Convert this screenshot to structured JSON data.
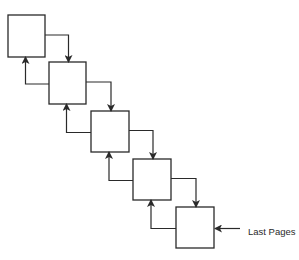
{
  "diagram": {
    "type": "linked-page-chain",
    "stroke_color": "#2a2a2a",
    "background": "#ffffff",
    "boxes": [
      {
        "id": "page-1",
        "x": 8,
        "y": 15,
        "w": 37,
        "h": 42
      },
      {
        "id": "page-2",
        "x": 49,
        "y": 62,
        "w": 37,
        "h": 42
      },
      {
        "id": "page-3",
        "x": 91,
        "y": 111,
        "w": 38,
        "h": 41
      },
      {
        "id": "page-4",
        "x": 133,
        "y": 159,
        "w": 38,
        "h": 41
      },
      {
        "id": "page-5",
        "x": 176,
        "y": 207,
        "w": 38,
        "h": 41
      }
    ],
    "pointer_label": "Last Pages",
    "pointer_target": "page-5"
  }
}
